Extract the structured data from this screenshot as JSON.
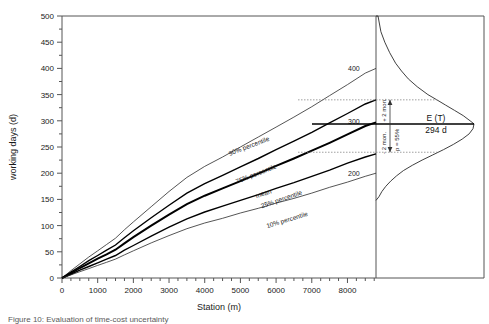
{
  "chart_data": {
    "type": "line",
    "title": "",
    "xlabel": "Station (m)",
    "ylabel": "working days (d)",
    "xlim": [
      0,
      8800
    ],
    "ylim": [
      0,
      500
    ],
    "xticks": [
      0,
      1000,
      2000,
      3000,
      4000,
      5000,
      6000,
      7000,
      8000
    ],
    "yticks": [
      0,
      50,
      100,
      150,
      200,
      250,
      300,
      350,
      400,
      450,
      500
    ],
    "xtick_labels": [
      "0",
      "1000",
      "2000",
      "3000",
      "4000",
      "5000",
      "6000",
      "7000",
      "8000"
    ],
    "ytick_labels": [
      "0",
      "50",
      "100",
      "150",
      "200",
      "250",
      "300",
      "350",
      "400",
      "450",
      "500"
    ],
    "grid": false,
    "legend": "inline-curve-labels",
    "x": [
      0,
      250,
      500,
      750,
      1000,
      1250,
      1500,
      1750,
      2000,
      2500,
      3000,
      3500,
      4000,
      4500,
      5000,
      5500,
      6000,
      6500,
      7000,
      7500,
      8000,
      8500,
      8800
    ],
    "series": [
      {
        "name": "90% percentile",
        "label": "90% percentile",
        "emphasis": "thin",
        "values": [
          0,
          14,
          27,
          40,
          52,
          64,
          76,
          92,
          107,
          136,
          165,
          192,
          213,
          231,
          250,
          269,
          288,
          307,
          327,
          348,
          369,
          391,
          400
        ]
      },
      {
        "name": "75% percentile",
        "label": "75% percentile",
        "emphasis": "medium",
        "values": [
          0,
          11,
          22,
          33,
          43,
          53,
          63,
          77,
          90,
          115,
          139,
          162,
          180,
          196,
          212,
          228,
          245,
          261,
          278,
          296,
          314,
          332,
          340
        ]
      },
      {
        "name": "mean",
        "label": "mean",
        "emphasis": "bold",
        "values": [
          0,
          9,
          19,
          28,
          37,
          45,
          54,
          66,
          78,
          100,
          121,
          141,
          157,
          171,
          185,
          199,
          214,
          228,
          243,
          258,
          274,
          290,
          297
        ]
      },
      {
        "name": "25% percentile",
        "label": "25% percentile",
        "emphasis": "medium",
        "values": [
          0,
          7,
          15,
          22,
          29,
          36,
          43,
          53,
          62,
          80,
          97,
          113,
          126,
          137,
          148,
          159,
          171,
          182,
          194,
          206,
          219,
          231,
          237
        ]
      },
      {
        "name": "10% percentile",
        "label": "10% percentile",
        "emphasis": "thin",
        "values": [
          0,
          6,
          12,
          18,
          24,
          30,
          36,
          44,
          52,
          67,
          81,
          94,
          105,
          114,
          124,
          133,
          143,
          152,
          162,
          173,
          183,
          194,
          200
        ]
      }
    ],
    "endpoint_labels": [
      {
        "text": "400",
        "series": "90% percentile",
        "value": 400
      },
      {
        "text": "300",
        "series": "mean",
        "value": 300
      },
      {
        "text": "200",
        "series": "10% percentile",
        "value": 200
      }
    ],
    "distribution_panel": {
      "description": "right-skewed probability density of total construction time T",
      "expected_value_label": "E (T)",
      "expected_value_text": "294 d",
      "expected_value": 294,
      "probability_label": "p = 55%",
      "probability": 55,
      "upper_bound_label": "+ 2 mon.",
      "lower_bound_label": "- 2 mon.",
      "upper_bound_value": 340,
      "lower_bound_value": 240,
      "pdf_y": [
        500,
        470,
        450,
        430,
        410,
        395,
        380,
        365,
        350,
        340,
        330,
        320,
        310,
        300,
        294,
        285,
        275,
        265,
        255,
        245,
        235,
        225,
        215,
        205,
        195,
        185,
        175,
        165,
        155,
        148
      ],
      "pdf_density": [
        0.02,
        0.05,
        0.09,
        0.14,
        0.2,
        0.26,
        0.33,
        0.42,
        0.53,
        0.62,
        0.71,
        0.8,
        0.89,
        0.96,
        1.0,
        0.99,
        0.95,
        0.88,
        0.79,
        0.69,
        0.58,
        0.47,
        0.37,
        0.28,
        0.21,
        0.15,
        0.1,
        0.06,
        0.03,
        0.0
      ]
    }
  },
  "caption": {
    "text": "Figure 10: Evaluation of time-cost uncertainty"
  }
}
